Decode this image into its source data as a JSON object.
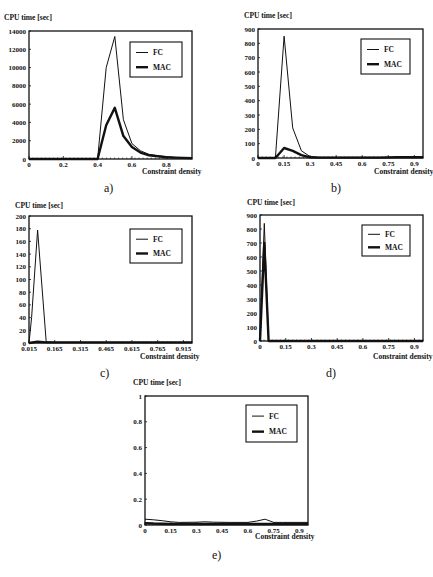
{
  "chart_data": [
    {
      "id": "a",
      "panel_label": "a)",
      "type": "line",
      "title": "",
      "ylabel": "CPU time [sec]",
      "xlabel": "Constraint density",
      "xlim": [
        0,
        0.95
      ],
      "ylim": [
        0,
        14000
      ],
      "xticks": [
        0,
        0.2,
        0.4,
        0.6,
        0.8
      ],
      "xtick_labels": [
        "0",
        "0.2",
        "0.4",
        "0.6",
        "0.8"
      ],
      "yticks": [
        0,
        2000,
        4000,
        6000,
        8000,
        10000,
        12000,
        14000
      ],
      "ytick_labels": [
        "0",
        "2000",
        "4000",
        "6000",
        "8000",
        "10000",
        "12000",
        "14000"
      ],
      "legend": [
        "FC",
        "MAC"
      ],
      "legend_position": "upper right",
      "grid": false,
      "series": [
        {
          "name": "FC",
          "x": [
            0,
            0.05,
            0.1,
            0.15,
            0.2,
            0.25,
            0.3,
            0.35,
            0.4,
            0.45,
            0.5,
            0.55,
            0.6,
            0.65,
            0.7,
            0.75,
            0.8,
            0.85,
            0.9,
            0.95
          ],
          "values": [
            0,
            0,
            0,
            0,
            0,
            0,
            0,
            0,
            0,
            10000,
            13400,
            4300,
            1700,
            900,
            500,
            350,
            250,
            180,
            150,
            120
          ]
        },
        {
          "name": "MAC",
          "x": [
            0,
            0.05,
            0.1,
            0.15,
            0.2,
            0.25,
            0.3,
            0.35,
            0.4,
            0.45,
            0.5,
            0.55,
            0.6,
            0.65,
            0.7,
            0.75,
            0.8,
            0.85,
            0.9,
            0.95
          ],
          "values": [
            0,
            0,
            0,
            0,
            0,
            0,
            0,
            0,
            0,
            3700,
            5600,
            2500,
            1300,
            700,
            400,
            300,
            200,
            150,
            120,
            100
          ]
        }
      ]
    },
    {
      "id": "b",
      "panel_label": "b)",
      "type": "line",
      "title": "",
      "ylabel": "CPU time [sec]",
      "xlabel": "Constraint density",
      "xlim": [
        0,
        0.95
      ],
      "ylim": [
        0,
        900
      ],
      "xticks": [
        0,
        0.15,
        0.3,
        0.45,
        0.6,
        0.75,
        0.9
      ],
      "xtick_labels": [
        "0",
        "0.15",
        "0.3",
        "0.45",
        "0.6",
        "0.75",
        "0.9"
      ],
      "yticks": [
        0,
        100,
        200,
        300,
        400,
        500,
        600,
        700,
        800,
        900
      ],
      "ytick_labels": [
        "0",
        "100",
        "200",
        "300",
        "400",
        "500",
        "600",
        "700",
        "800",
        "900"
      ],
      "legend": [
        "FC",
        "MAC"
      ],
      "legend_position": "upper right",
      "grid": false,
      "series": [
        {
          "name": "FC",
          "x": [
            0,
            0.05,
            0.1,
            0.15,
            0.2,
            0.25,
            0.3,
            0.35,
            0.4,
            0.5,
            0.6,
            0.7,
            0.8,
            0.9,
            0.95
          ],
          "values": [
            0,
            0,
            0,
            850,
            210,
            50,
            10,
            5,
            5,
            5,
            5,
            5,
            5,
            5,
            5
          ]
        },
        {
          "name": "MAC",
          "x": [
            0,
            0.05,
            0.1,
            0.15,
            0.2,
            0.25,
            0.3,
            0.35,
            0.4,
            0.5,
            0.6,
            0.7,
            0.8,
            0.9,
            0.95
          ],
          "values": [
            0,
            0,
            0,
            70,
            50,
            20,
            5,
            3,
            3,
            3,
            3,
            3,
            5,
            5,
            5
          ]
        }
      ]
    },
    {
      "id": "c",
      "panel_label": "c)",
      "type": "line",
      "title": "",
      "ylabel": "CPU time [sec]",
      "xlabel": "Constraint density",
      "xlim": [
        0.015,
        0.965
      ],
      "ylim": [
        0,
        200
      ],
      "xticks": [
        0.015,
        0.165,
        0.315,
        0.465,
        0.615,
        0.765,
        0.915
      ],
      "xtick_labels": [
        "0.015",
        "0.165",
        "0.315",
        "0.465",
        "0.615",
        "0.765",
        "0.915"
      ],
      "yticks": [
        0,
        20,
        40,
        60,
        80,
        100,
        120,
        140,
        160,
        180,
        200
      ],
      "ytick_labels": [
        "0",
        "20",
        "40",
        "60",
        "80",
        "100",
        "120",
        "140",
        "160",
        "180",
        "200"
      ],
      "legend": [
        "FC",
        "MAC"
      ],
      "legend_position": "upper right",
      "grid": false,
      "series": [
        {
          "name": "FC",
          "x": [
            0.015,
            0.03,
            0.065,
            0.115,
            0.165,
            0.315,
            0.465,
            0.615,
            0.765,
            0.915,
            0.965
          ],
          "values": [
            0,
            40,
            178,
            2,
            1,
            1,
            1,
            1,
            1,
            1,
            1
          ]
        },
        {
          "name": "MAC",
          "x": [
            0.015,
            0.065,
            0.115,
            0.165,
            0.315,
            0.465,
            0.615,
            0.765,
            0.915,
            0.965
          ],
          "values": [
            0,
            2,
            1,
            1,
            1,
            1,
            1,
            1,
            1,
            1
          ]
        }
      ]
    },
    {
      "id": "d",
      "panel_label": "d)",
      "type": "line",
      "title": "",
      "ylabel": "CPU time [sec]",
      "xlabel": "Constraint density",
      "xlim": [
        0,
        0.95
      ],
      "ylim": [
        0,
        900
      ],
      "xticks": [
        0,
        0.15,
        0.3,
        0.45,
        0.6,
        0.75,
        0.9
      ],
      "xtick_labels": [
        "0",
        "0.15",
        "0.3",
        "0.45",
        "0.6",
        "0.75",
        "0.9"
      ],
      "yticks": [
        0,
        100,
        200,
        300,
        400,
        500,
        600,
        700,
        800,
        900
      ],
      "ytick_labels": [
        "0",
        "100",
        "200",
        "300",
        "400",
        "500",
        "600",
        "700",
        "800",
        "900"
      ],
      "legend": [
        "FC",
        "MAC"
      ],
      "legend_position": "upper right",
      "grid": false,
      "series": [
        {
          "name": "FC",
          "x": [
            0,
            0.025,
            0.05,
            0.1,
            0.3,
            0.6,
            0.9,
            0.95
          ],
          "values": [
            0,
            840,
            0,
            0,
            0,
            0,
            0,
            0
          ]
        },
        {
          "name": "MAC",
          "x": [
            0,
            0.025,
            0.05,
            0.1,
            0.3,
            0.6,
            0.9,
            0.95
          ],
          "values": [
            0,
            700,
            0,
            0,
            0,
            0,
            0,
            0
          ]
        }
      ]
    },
    {
      "id": "e",
      "panel_label": "e)",
      "type": "line",
      "title": "",
      "ylabel": "CPU time [sec]",
      "xlabel": "Constraint density",
      "xlim": [
        0,
        0.95
      ],
      "ylim": [
        0,
        1
      ],
      "xticks": [
        0,
        0.15,
        0.3,
        0.45,
        0.6,
        0.75,
        0.9
      ],
      "xtick_labels": [
        "0",
        "0.15",
        "0.3",
        "0.45",
        "0.6",
        "0.75",
        "0.9"
      ],
      "yticks": [
        0,
        0.2,
        0.4,
        0.6,
        0.8,
        1
      ],
      "ytick_labels": [
        "0",
        "0.2",
        "0.4",
        "0.6",
        "0.8",
        "1"
      ],
      "legend": [
        "FC",
        "MAC"
      ],
      "legend_position": "upper right",
      "grid": false,
      "series": [
        {
          "name": "FC",
          "x": [
            0,
            0.05,
            0.1,
            0.15,
            0.2,
            0.3,
            0.35,
            0.4,
            0.5,
            0.6,
            0.65,
            0.7,
            0.75,
            0.8,
            0.9,
            0.95
          ],
          "values": [
            0.045,
            0.04,
            0.033,
            0.025,
            0.02,
            0.022,
            0.025,
            0.022,
            0.02,
            0.02,
            0.03,
            0.045,
            0.02,
            0.02,
            0.02,
            0.02
          ]
        },
        {
          "name": "MAC",
          "x": [
            0,
            0.05,
            0.1,
            0.15,
            0.2,
            0.3,
            0.4,
            0.5,
            0.6,
            0.7,
            0.8,
            0.9,
            0.95
          ],
          "values": [
            0.015,
            0.012,
            0.01,
            0.008,
            0.008,
            0.008,
            0.008,
            0.008,
            0.008,
            0.008,
            0.008,
            0.008,
            0.008
          ]
        }
      ]
    }
  ],
  "layout": {
    "panels": [
      {
        "id": "a",
        "plot": {
          "x": 29,
          "y": 31,
          "w": 163,
          "h": 128
        },
        "legend": {
          "x": 130,
          "y": 42,
          "w": 52,
          "h": 35
        },
        "ylabel_pos": {
          "x": 4,
          "y": 14
        },
        "xlabel_pos": {
          "x": 142,
          "y": 168
        },
        "panel_label_pos": {
          "x": 104,
          "y": 182
        }
      },
      {
        "id": "b",
        "plot": {
          "x": 258,
          "y": 29,
          "w": 165,
          "h": 129
        },
        "legend": {
          "x": 361,
          "y": 39,
          "w": 49,
          "h": 35
        },
        "ylabel_pos": {
          "x": 244,
          "y": 12
        },
        "xlabel_pos": {
          "x": 374,
          "y": 168
        },
        "panel_label_pos": {
          "x": 331,
          "y": 182
        }
      },
      {
        "id": "c",
        "plot": {
          "x": 29,
          "y": 216,
          "w": 163,
          "h": 127
        },
        "legend": {
          "x": 130,
          "y": 229,
          "w": 52,
          "h": 34
        },
        "ylabel_pos": {
          "x": 15,
          "y": 202
        },
        "xlabel_pos": {
          "x": 140,
          "y": 353
        },
        "panel_label_pos": {
          "x": 100,
          "y": 367
        }
      },
      {
        "id": "d",
        "plot": {
          "x": 260,
          "y": 215,
          "w": 163,
          "h": 126
        },
        "legend": {
          "x": 362,
          "y": 225,
          "w": 48,
          "h": 31
        },
        "ylabel_pos": {
          "x": 247,
          "y": 199
        },
        "xlabel_pos": {
          "x": 373,
          "y": 353
        },
        "panel_label_pos": {
          "x": 326,
          "y": 367
        }
      },
      {
        "id": "e",
        "plot": {
          "x": 145,
          "y": 396,
          "w": 163,
          "h": 129
        },
        "legend": {
          "x": 246,
          "y": 405,
          "w": 51,
          "h": 37
        },
        "ylabel_pos": {
          "x": 133,
          "y": 379
        },
        "xlabel_pos": {
          "x": 255,
          "y": 533
        },
        "panel_label_pos": {
          "x": 212,
          "y": 549
        }
      }
    ]
  }
}
